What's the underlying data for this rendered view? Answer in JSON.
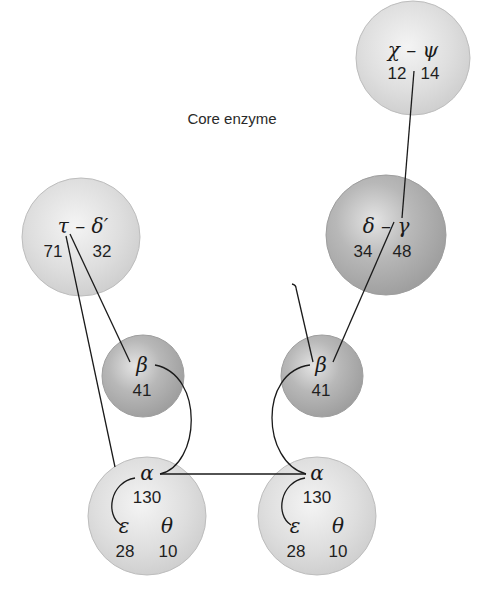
{
  "diagram": {
    "annotation": {
      "line1": "Core enzyme",
      "line2": "(dimerized)"
    },
    "colors": {
      "light_subunit": "#d9d9d9",
      "dark_subunit": "#a8a8a8",
      "line": "#1a1a1a",
      "background": "#ffffff"
    },
    "subunits": {
      "chi_psi": {
        "symbols": "χ – ψ",
        "left": "12",
        "right": "14",
        "shade": "light"
      },
      "delta_gamma": {
        "symbols": "δ – γ",
        "left": "34",
        "right": "48",
        "shade": "dark"
      },
      "tau_deltaprime": {
        "symbols": "τ – δ′",
        "left": "71",
        "right": "32",
        "shade": "light"
      },
      "beta_left": {
        "symbol": "β",
        "value": "41",
        "shade": "dark"
      },
      "beta_right": {
        "symbol": "β",
        "value": "41",
        "shade": "dark"
      },
      "core_left": {
        "alpha": "α",
        "alpha_value": "130",
        "epsilon": "ε",
        "epsilon_value": "28",
        "theta": "θ",
        "theta_value": "10",
        "shade": "light"
      },
      "core_right": {
        "alpha": "α",
        "alpha_value": "130",
        "epsilon": "ε",
        "epsilon_value": "28",
        "theta": "θ",
        "theta_value": "10",
        "shade": "light"
      }
    }
  }
}
